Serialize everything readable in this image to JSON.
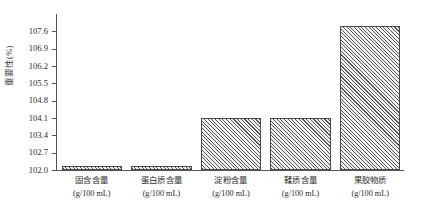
{
  "chart_data": {
    "type": "bar",
    "title": "",
    "xlabel": "",
    "ylabel": "重要性(%)",
    "categories": [
      "固含含量",
      "蛋白质含量",
      "淀粉含量",
      "鞣质含量",
      "果胶物质"
    ],
    "category_units": [
      "(g/100 mL)",
      "(g/100 mL)",
      "(g/100 mL)",
      "(g/100 mL)",
      "(g/100 mL)"
    ],
    "values": [
      102.15,
      102.15,
      104.1,
      104.1,
      107.8
    ],
    "ylim": [
      102.0,
      108.3
    ],
    "yticks": [
      "102.0",
      "102.7",
      "103.4",
      "104.1",
      "104.8",
      "105.5",
      "106.2",
      "106.9",
      "107.6"
    ],
    "ytick_values": [
      102.0,
      102.7,
      103.4,
      104.1,
      104.8,
      105.5,
      106.2,
      106.9,
      107.6
    ],
    "grid": false,
    "legend": "none",
    "bar_fill": "hatched-diagonal",
    "bar_edge_color": "#4a4a4a",
    "axis_color": "#555555"
  }
}
